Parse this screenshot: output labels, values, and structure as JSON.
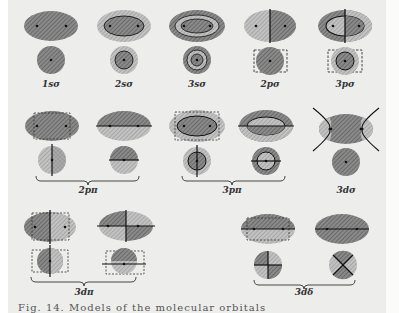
{
  "figure": {
    "caption_partial": "Fig. 14. Models of the molecular orbitals",
    "colors": {
      "page_background": "#ededeb",
      "dark_hatch": "#6f6f6f",
      "light_hatch": "#a9a9a9",
      "line": "#222222"
    },
    "orbitals": [
      {
        "label": "1sσ",
        "group": "row1"
      },
      {
        "label": "2sσ",
        "group": "row1"
      },
      {
        "label": "3sσ",
        "group": "row1"
      },
      {
        "label": "2pσ",
        "group": "row1"
      },
      {
        "label": "3pσ",
        "group": "row1"
      },
      {
        "label": "2pπ",
        "group": "row2",
        "pair": true
      },
      {
        "label": "3pπ",
        "group": "row2",
        "pair": true
      },
      {
        "label": "3dσ",
        "group": "row2"
      },
      {
        "label": "3dπ",
        "group": "row3",
        "pair": true
      },
      {
        "label": "3dδ",
        "group": "row3",
        "pair": true
      }
    ]
  }
}
